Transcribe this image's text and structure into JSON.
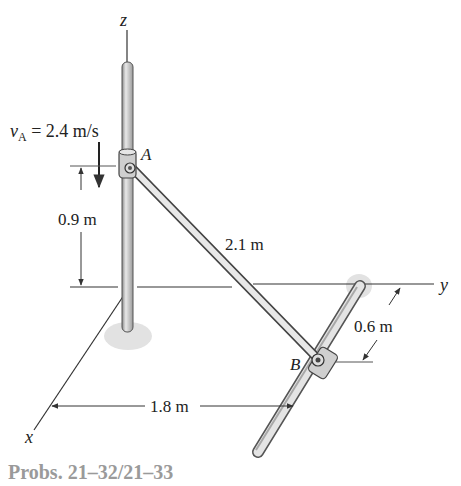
{
  "figure": {
    "caption": "Probs. 21–32/21–33",
    "axes": {
      "z": "z",
      "y": "y",
      "x": "x"
    },
    "points": {
      "A": "A",
      "B": "B"
    },
    "velocity": {
      "symbol": "v",
      "subscript": "A",
      "text": " = 2.4 m/s"
    },
    "dimensions": {
      "height_A": "0.9 m",
      "rod_length": "2.1 m",
      "offset_B": "0.6 m",
      "distance_x": "1.8 m"
    },
    "colors": {
      "rod_fill": "#d9d9d9",
      "rod_stroke": "#555555",
      "line": "#333333",
      "shadow": "#dcdcdc",
      "caption": "#9a9a9a"
    }
  }
}
